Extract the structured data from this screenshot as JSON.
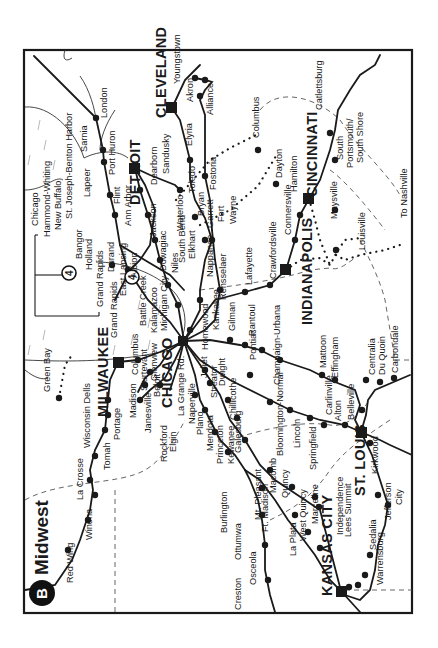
{
  "map": {
    "title": "Midwest",
    "badge": "B",
    "frame": {
      "x": 24,
      "y": 50,
      "w": 388,
      "h": 563
    },
    "hubs": [
      {
        "name": "CLEVELAND",
        "x": 172,
        "y": 108,
        "lx": 166,
        "ly": 118
      },
      {
        "name": "DETROIT",
        "x": 135,
        "y": 168,
        "lx": 140,
        "ly": 205
      },
      {
        "name": "CINCINNATI",
        "x": 309,
        "y": 199,
        "lx": 317,
        "ly": 197
      },
      {
        "name": "INDIANAPOLIS",
        "x": 286,
        "y": 270,
        "lx": 312,
        "ly": 325
      },
      {
        "name": "MILWAUKEE",
        "x": 118,
        "y": 362,
        "lx": 108,
        "ly": 417
      },
      {
        "name": "CHICAGO",
        "x": 184,
        "y": 341,
        "lx": 172,
        "ly": 408
      },
      {
        "name": "ST. LOUIS",
        "x": 361,
        "y": 432,
        "lx": 365,
        "ly": 496
      },
      {
        "name": "KANSAS CITY",
        "x": 341,
        "y": 591,
        "lx": 332,
        "ly": 596
      }
    ],
    "labels": [
      {
        "text": "London",
        "x": 107,
        "y": 118
      },
      {
        "text": "Sarnia",
        "x": 87,
        "y": 152
      },
      {
        "text": "Port Huron",
        "x": 115,
        "y": 175
      },
      {
        "text": "Lapeer",
        "x": 90,
        "y": 197
      },
      {
        "text": "Flint",
        "x": 120,
        "y": 204
      },
      {
        "text": "St. Joseph-Benton Harbor",
        "x": 72,
        "y": 219
      },
      {
        "text": "New Buffalo",
        "x": 61,
        "y": 230
      },
      {
        "text": "Hammond-Whiting",
        "x": 50,
        "y": 237
      },
      {
        "text": "Chicago",
        "x": 38,
        "y": 226
      },
      {
        "text": "Bangor",
        "x": 82,
        "y": 259
      },
      {
        "text": "Holland",
        "x": 92,
        "y": 270
      },
      {
        "text": "Grand Rapids",
        "x": 103,
        "y": 307
      },
      {
        "text": "Durand",
        "x": 114,
        "y": 272
      },
      {
        "text": "Grand Rapids",
        "x": 117,
        "y": 338
      },
      {
        "text": "East Lansing",
        "x": 126,
        "y": 296
      },
      {
        "text": "Ann Arbor",
        "x": 131,
        "y": 226
      },
      {
        "text": "Albion",
        "x": 137,
        "y": 278
      },
      {
        "text": "Battle Creek",
        "x": 146,
        "y": 326
      },
      {
        "text": "Kalamazoo",
        "x": 157,
        "y": 333
      },
      {
        "text": "Michigan City",
        "x": 167,
        "y": 331
      },
      {
        "text": "Dearborn",
        "x": 157,
        "y": 185
      },
      {
        "text": "Sandusky",
        "x": 169,
        "y": 174
      },
      {
        "text": "Jackson",
        "x": 156,
        "y": 237
      },
      {
        "text": "Dowagiac",
        "x": 166,
        "y": 271
      },
      {
        "text": "Niles",
        "x": 178,
        "y": 273
      },
      {
        "text": "South Bend",
        "x": 185,
        "y": 263
      },
      {
        "text": "Waterloo",
        "x": 183,
        "y": 231
      },
      {
        "text": "Toledo",
        "x": 195,
        "y": 193
      },
      {
        "text": "Elkhart",
        "x": 195,
        "y": 259
      },
      {
        "text": "Bryan",
        "x": 204,
        "y": 216
      },
      {
        "text": "Elyria",
        "x": 192,
        "y": 146
      },
      {
        "text": "Akron",
        "x": 193,
        "y": 102
      },
      {
        "text": "Youngstown",
        "x": 180,
        "y": 84
      },
      {
        "text": "Alliance",
        "x": 213,
        "y": 115
      },
      {
        "text": "Fostoria",
        "x": 216,
        "y": 190
      },
      {
        "text": "Garrett",
        "x": 213,
        "y": 228
      },
      {
        "text": "Fort",
        "x": 224,
        "y": 222
      },
      {
        "text": "Wayne",
        "x": 236,
        "y": 224
      },
      {
        "text": "Nappanee",
        "x": 213,
        "y": 277
      },
      {
        "text": "Rensselaer",
        "x": 226,
        "y": 300
      },
      {
        "text": "Columbus",
        "x": 259,
        "y": 138
      },
      {
        "text": "Dayton",
        "x": 282,
        "y": 178
      },
      {
        "text": "Hamilton",
        "x": 297,
        "y": 192
      },
      {
        "text": "Connersville",
        "x": 291,
        "y": 235
      },
      {
        "text": "Crawfordsville",
        "x": 276,
        "y": 279
      },
      {
        "text": "Lafayette",
        "x": 252,
        "y": 285
      },
      {
        "text": "Catlettsburg",
        "x": 322,
        "y": 110
      },
      {
        "text": "South",
        "x": 343,
        "y": 160
      },
      {
        "text": "Portsmouth/",
        "x": 353,
        "y": 168
      },
      {
        "text": "South Shore",
        "x": 363,
        "y": 163
      },
      {
        "text": "Maysville",
        "x": 337,
        "y": 219
      },
      {
        "text": "Louisville",
        "x": 365,
        "y": 250
      },
      {
        "text": "To Nashville",
        "x": 407,
        "y": 218
      },
      {
        "text": "Kankakee",
        "x": 219,
        "y": 330
      },
      {
        "text": "Gilman",
        "x": 235,
        "y": 331
      },
      {
        "text": "Rantoul",
        "x": 255,
        "y": 336
      },
      {
        "text": "Homewood",
        "x": 208,
        "y": 350
      },
      {
        "text": "Pontiac",
        "x": 256,
        "y": 360
      },
      {
        "text": "Champaign-Urbana",
        "x": 280,
        "y": 385
      },
      {
        "text": "Mattoon",
        "x": 326,
        "y": 368
      },
      {
        "text": "Effingham",
        "x": 338,
        "y": 378
      },
      {
        "text": "Centralia",
        "x": 375,
        "y": 375
      },
      {
        "text": "Du Quoin",
        "x": 385,
        "y": 375
      },
      {
        "text": "Carbondale",
        "x": 398,
        "y": 373
      },
      {
        "text": "Bloomington-Normal",
        "x": 283,
        "y": 456
      },
      {
        "text": "Carlinville",
        "x": 332,
        "y": 415
      },
      {
        "text": "Alton",
        "x": 341,
        "y": 421
      },
      {
        "text": "Belleville",
        "x": 354,
        "y": 420
      },
      {
        "text": "Lincoln",
        "x": 300,
        "y": 448
      },
      {
        "text": "Springfield",
        "x": 316,
        "y": 470
      },
      {
        "text": "Kirkwood",
        "x": 378,
        "y": 474
      },
      {
        "text": "Columbus",
        "x": 138,
        "y": 375
      },
      {
        "text": "Sturtevant",
        "x": 147,
        "y": 391
      },
      {
        "text": "Glenview",
        "x": 157,
        "y": 381
      },
      {
        "text": "Beloit",
        "x": 160,
        "y": 397
      },
      {
        "text": "Madison",
        "x": 136,
        "y": 418
      },
      {
        "text": "Janesville",
        "x": 151,
        "y": 433
      },
      {
        "text": "La Grange Rd.",
        "x": 184,
        "y": 416
      },
      {
        "text": "Naperville",
        "x": 195,
        "y": 424
      },
      {
        "text": "Joliet",
        "x": 207,
        "y": 378
      },
      {
        "text": "Plano",
        "x": 203,
        "y": 435
      },
      {
        "text": "Streator",
        "x": 217,
        "y": 398
      },
      {
        "text": "Dwight",
        "x": 225,
        "y": 386
      },
      {
        "text": "Chillicothe",
        "x": 236,
        "y": 420
      },
      {
        "text": "Mendota",
        "x": 213,
        "y": 451
      },
      {
        "text": "Princeton",
        "x": 223,
        "y": 464
      },
      {
        "text": "Kewanee",
        "x": 234,
        "y": 464
      },
      {
        "text": "Galesburg",
        "x": 241,
        "y": 453
      },
      {
        "text": "Rockford",
        "x": 167,
        "y": 462
      },
      {
        "text": "Elgin",
        "x": 176,
        "y": 452
      },
      {
        "text": "Green Bay",
        "x": 50,
        "y": 392
      },
      {
        "text": "Wisconsin Dells",
        "x": 90,
        "y": 448
      },
      {
        "text": "Portage",
        "x": 120,
        "y": 440
      },
      {
        "text": "Tomah",
        "x": 110,
        "y": 470
      },
      {
        "text": "La Crosse",
        "x": 83,
        "y": 500
      },
      {
        "text": "Winona",
        "x": 92,
        "y": 540
      },
      {
        "text": "Red Wing",
        "x": 73,
        "y": 583
      },
      {
        "text": "Burlington",
        "x": 227,
        "y": 533
      },
      {
        "text": "Mt. Pleasant",
        "x": 261,
        "y": 520
      },
      {
        "text": "Ft. Madison",
        "x": 268,
        "y": 532
      },
      {
        "text": "Macomb",
        "x": 276,
        "y": 493
      },
      {
        "text": "Quincy",
        "x": 288,
        "y": 498
      },
      {
        "text": "Ottumwa",
        "x": 241,
        "y": 560
      },
      {
        "text": "Osceola",
        "x": 256,
        "y": 585
      },
      {
        "text": "Creston",
        "x": 241,
        "y": 610
      },
      {
        "text": "La Plata",
        "x": 296,
        "y": 556
      },
      {
        "text": "West Quincy",
        "x": 306,
        "y": 541
      },
      {
        "text": "Marceline",
        "x": 318,
        "y": 524
      },
      {
        "text": "Independence",
        "x": 343,
        "y": 535
      },
      {
        "text": "Lees Summit",
        "x": 351,
        "y": 537
      },
      {
        "text": "Sedalia",
        "x": 376,
        "y": 550
      },
      {
        "text": "Warrensburg",
        "x": 383,
        "y": 585
      },
      {
        "text": "Jefferson",
        "x": 391,
        "y": 520
      },
      {
        "text": "City",
        "x": 402,
        "y": 505
      }
    ],
    "route_badges": [
      {
        "num": "4",
        "x": 69,
        "y": 273
      },
      {
        "num": "4",
        "x": 132,
        "y": 277
      }
    ]
  }
}
